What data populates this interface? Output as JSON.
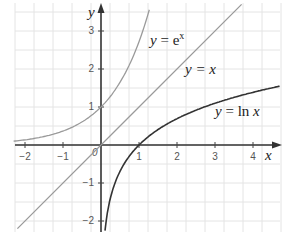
{
  "chart_data": {
    "type": "line",
    "title": "",
    "xlabel": "x",
    "ylabel": "y",
    "xlim": [
      -2.3,
      4.7
    ],
    "ylim": [
      -2.2,
      3.7
    ],
    "grid": true,
    "x_ticks": [
      "-2",
      "-1",
      "0",
      "1",
      "2",
      "3",
      "4"
    ],
    "y_ticks": [
      "-2",
      "-1",
      "1",
      "2",
      "3"
    ],
    "series": [
      {
        "name": "y = e^x",
        "color": "#9a9a9a",
        "function": "exp(x)",
        "x": [
          -2.3,
          -2,
          -1,
          0,
          0.5,
          1,
          1.25
        ],
        "y": [
          0.1,
          0.135,
          0.368,
          1,
          1.649,
          2.718,
          3.49
        ]
      },
      {
        "name": "y = x",
        "color": "#9a9a9a",
        "function": "x",
        "x": [
          -2.2,
          0,
          3.7
        ],
        "y": [
          -2.2,
          0,
          3.7
        ]
      },
      {
        "name": "y = ln x",
        "color": "#333333",
        "function": "ln(x)",
        "x": [
          0.11,
          0.25,
          0.5,
          1,
          2,
          3,
          4,
          4.7
        ],
        "y": [
          -2.2,
          -1.386,
          -0.693,
          0,
          0.693,
          1.099,
          1.386,
          1.548
        ]
      }
    ],
    "annotations": [
      {
        "text": "y = e^x",
        "at": [
          1.4,
          2.85
        ]
      },
      {
        "text": "y = x",
        "at": [
          2.2,
          1.9
        ]
      },
      {
        "text": "y = ln x",
        "at": [
          3.0,
          0.85
        ]
      }
    ]
  },
  "labels": {
    "x_axis": "x",
    "y_axis": "y",
    "origin": "0",
    "ex_y": "y",
    "ex_eq": " = e",
    "ex_sup": "x",
    "lin_text": "y = x",
    "ln_y": "y",
    "ln_eq": " = ",
    "ln_fn": "ln",
    "ln_x": " x",
    "ticks_x": [
      "−2",
      "−1",
      "1",
      "2",
      "3",
      "4"
    ],
    "ticks_y": [
      "3",
      "2",
      "1",
      "−1",
      "−2"
    ]
  }
}
